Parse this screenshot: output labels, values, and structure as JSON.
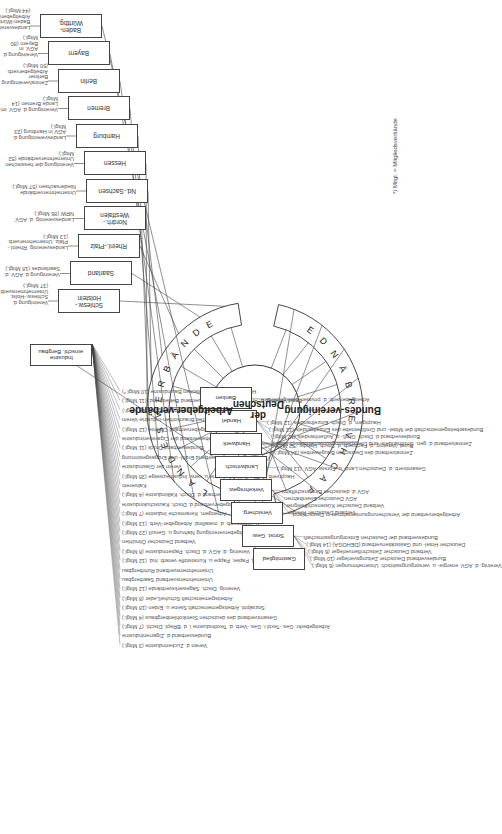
{
  "center": {
    "lines": [
      "Bundes-",
      "vereinigung",
      "der Deutschen",
      "Arbeitgeber-",
      "verbände"
    ]
  },
  "arcs": {
    "landesverbaende": "LANDESVERBÄNDE",
    "fachverbaende": "FACHVERBÄNDE"
  },
  "footnote": "*) Mitgl. = Mitgliedsverbände",
  "landesverbaende": [
    {
      "box": "Baden-\nWürttbg.",
      "label": "Landesvereinigung Baden-Württbg. Arbeitgeberverb. (44 Mitgl.)"
    },
    {
      "box": "Bayern",
      "label": "Vereinigung d. AGV. in Bayern (80 Mitgl.)"
    },
    {
      "box": "Berlin",
      "label": "Zentralvereinigung Berliner Arbeitgeberverb. (50 Mitgl.)"
    },
    {
      "box": "Bremen",
      "label": "Vereinigung d. AGV. im Lande Bremen (14 Mitgl.)"
    },
    {
      "box": "Hamburg",
      "label": "Landesvereinigung d. AGV in Hamburg (23 Mitgl.)"
    },
    {
      "box": "Hessen",
      "label": "Vereinigung der hessischen\nUnternehmerverbände (52 Mitgl.)"
    },
    {
      "box": "Nd.-Sachsen",
      "label": "Unternehmerverbände Niedersachsen (57 Mitgl.)"
    },
    {
      "box": "Nordrh.-\nWestfalen",
      "label": "Landesvereinig. d. AGV. NRW (86 Mitgl.)"
    },
    {
      "box": "Rheinl.-Pfalz",
      "label": "Landesvereinig. Rheinl.-Pfälz. Unternehmerverb. (13 Mitgl.)"
    },
    {
      "box": "Saarland",
      "label": "Vereinigung d. AGV. d. Saarlandes (18 Mitgl.)"
    },
    {
      "box": "Schlesw.-\nHolstein",
      "label": "Vereinigung d. Schlesw.-Holst. Unternehmensverb. (37 Mitgl.)"
    }
  ],
  "fachverbaende": {
    "industrie": {
      "box": "Industrie\neinschl. Bergbau",
      "members": [
        "Hauptverband der Deutschen Bauindustrie (10 Mitgl.*)",
        "Bund.Vereinig. d. Arbeitgeber im Bundesverband Bekleid.-Ind. (11 Mitgl.)",
        "Wirtschaftsvereinigung Bergbau (16 Mitgl.)",
        "Deutscher Braunkohlen-Industrie-Verein",
        "Bundesarbeitgeberverband Chemie (12 Mitgl.)",
        "Arbeitgeberverband der Cigarettenindustrie",
        "Bundesverband Druck (11 Mitgl.)",
        "Wirtschaftsverband Erdöl- und Erdgasgewinnung",
        "Verein der Glasindustrie",
        "Hauptverb. d. Dtsch. Holzindustrie u. verw. Industriezweige (38 Mitgl.)",
        "Kaliverein",
        "Bundesverband d. Dtsch. Kalkindustrie (4 Mitgl.)",
        "Arbeitgeberverband d. Dtsch. Kautschukindustrie",
        "Arbeitgem. Keramische Industrie (7 Mitgl.)",
        "Gesamtverb. d. metallind. Arbeitgeber-Verb. (13 Mitgl.)",
        "Arbeitgebervereinigung Nahrung u. Genuß (23 Mitgl.)",
        "Verband Deutscher Ölmühlen",
        "Vereinig. d. AGV. d. Dtsch. Papierindustrie (8 Mitgl.)",
        "Hauptverb. d. Papier, Pappe u. Kunststoffe verarb. Ind. (12 Mitgl.)",
        "Unternehmensverband Ruhrbergbau",
        "Unternehmensverband Saarbergbau",
        "Vereinig. Dtsch. Sägewerksverbände (12 Mitgl.)",
        "Arbeitsgemeinschaft Schuhe/Leder (8 Mitgl.)",
        "Sozialpol. Arbeitsgemeinschaft Steine u. Erden (18 Mitgl.)",
        "Gesamtverband des deutschen Steinkohlenbergbaus (4 Mitgl.)",
        "Arbeitgeberkr. Ges.-Textil i. Ges.-Verb. d. Textilindustrie i. d. BRepl. Dtschl. (7 Mitgl.)",
        "Bundesverband d. Zigarrenindustrie",
        "Verein d. Zuckerindustrie (3 Mitgl.)"
      ]
    },
    "groups": [
      {
        "box": "Banken",
        "members": [
          "Arbeitgeberverb. d. privaten Bankgewerbes"
        ]
      },
      {
        "box": "Handel",
        "members": [
          "Hauptgem. d. Dtsch. Einzelhandels (12 Mitgl.)",
          "Bundesarbeitsgemeinschaft der Mittel- und Großbetriebe des Einzelhandels (12 Mitgl.)",
          "Bundesverband d. Dtsch. Groß- u. Außenhandels (12 Mitgl.)",
          "Zentralverband d. gen. Großhandels- und Dienstleistungsunternehmen (5 Mitgl.)"
        ]
      },
      {
        "box": "Handwerk",
        "members": [
          "Bund.-Vereinig. d. Fachverb. d. Dtsch. Handw. (52 Mitgl.)",
          "Zentralverband des Deutschen Baugewerbes (24 Mitgl.)"
        ]
      },
      {
        "box": "Landwirtsch.",
        "members": [
          "Gesamtverb. d. Deutschen Land- u. Forstw. AGV. (13 Mitgl.)"
        ]
      },
      {
        "box": "Verkehrsgew.",
        "members": [
          "AGV d. deutschen Binnenschiffahrt",
          "AGV Deutscher Eisenbahnen",
          "Verband Deutscher Küstenschiffseigner",
          "Verband Deutscher Reeder"
        ]
      },
      {
        "box": "Versicherg.",
        "members": [
          "Arbeitgeberverband der Versicherungsunternehmen in Deutschland"
        ]
      },
      {
        "box": "Sonst. Gew.",
        "members": [
          "Bundesverband der Deutschen Entsorgungswirtschaft",
          "Deutscher Hotel- und Gaststättenverband (DEHOGA) (14 Mitgl.)",
          "Verband Deutscher Zeitschriftenverleger (6 Mitgl.)",
          "Bundesverband Deutscher Zeitungsverleger (10 Mitgl.)",
          "Vereinig. d. AGV. energie- u. versorgungswirtsch. Unternehmungen (6 Mitgl.)"
        ]
      },
      {
        "box": "Gastmitglied",
        "members": []
      }
    ]
  }
}
